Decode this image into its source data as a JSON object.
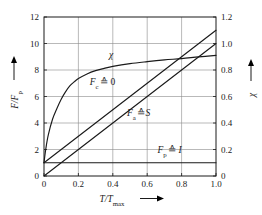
{
  "chart_data": {
    "type": "line",
    "title": "",
    "xlabel": "T/Tmax",
    "ylabel": "F/Fp",
    "y2label": "chi",
    "xlim": [
      0,
      1.0
    ],
    "ylim": [
      0,
      12
    ],
    "y2lim": [
      0,
      1.2
    ],
    "grid": true,
    "legend": "inline-annotations",
    "x_ticks": [
      "0",
      "0.2",
      "0.4",
      "0.6",
      "0.8",
      "1.0"
    ],
    "x_tick_values": [
      0,
      0.2,
      0.4,
      0.6,
      0.8,
      1.0
    ],
    "y_ticks": [
      "0",
      "2",
      "4",
      "6",
      "8",
      "10",
      "12"
    ],
    "y_tick_values": [
      0,
      2,
      4,
      6,
      8,
      10,
      12
    ],
    "y2_ticks": [
      "0",
      "0.2",
      "0.4",
      "0.6",
      "0.8",
      "1.0",
      "1.2"
    ],
    "y2_tick_values": [
      0,
      0.2,
      0.4,
      0.6,
      0.8,
      1.0,
      1.2
    ],
    "series": [
      {
        "name": "chi",
        "axis": "right",
        "x": [
          0.0,
          0.01,
          0.025,
          0.05,
          0.075,
          0.1,
          0.125,
          0.15,
          0.175,
          0.2,
          0.25,
          0.3,
          0.35,
          0.4,
          0.5,
          0.6,
          0.7,
          0.8,
          0.9,
          1.0
        ],
        "values_left_axis": [
          1.0,
          2.0,
          3.1,
          4.3,
          5.1,
          5.8,
          6.35,
          6.8,
          7.1,
          7.35,
          7.7,
          7.95,
          8.12,
          8.27,
          8.48,
          8.63,
          8.76,
          8.86,
          8.99,
          9.1
        ],
        "values_right_axis": [
          0.1,
          0.2,
          0.31,
          0.43,
          0.51,
          0.58,
          0.635,
          0.68,
          0.71,
          0.735,
          0.77,
          0.795,
          0.812,
          0.827,
          0.848,
          0.863,
          0.876,
          0.886,
          0.899,
          0.91
        ]
      },
      {
        "name": "Fc",
        "axis": "left",
        "x": [
          0.0,
          1.0
        ],
        "values": [
          1.0,
          11.0
        ]
      },
      {
        "name": "Fa",
        "axis": "left",
        "x": [
          0.0,
          1.0
        ],
        "values": [
          0.0,
          10.0
        ]
      },
      {
        "name": "Fp",
        "axis": "left",
        "x": [
          0.0,
          1.0
        ],
        "values": [
          1.0,
          1.0
        ]
      }
    ],
    "annotations": [
      {
        "id": "chi",
        "text": "chi",
        "x": 0.39,
        "y_left": 8.9
      },
      {
        "id": "fc",
        "text": "Fc = 0",
        "x": 0.34,
        "y_left": 6.9
      },
      {
        "id": "fa",
        "text": "Fa = S",
        "x": 0.55,
        "y_left": 4.55
      },
      {
        "id": "fp",
        "text": "Fp = I",
        "x": 0.73,
        "y_left": 1.75
      }
    ]
  },
  "labels": {
    "x_axis_base": "T",
    "x_axis_sub": "max",
    "x_axis_num": "T/T",
    "y_axis_num": "F/F",
    "y_axis_sub": "p",
    "y2_axis": "χ",
    "ann_chi": "χ",
    "ann_fc_base": "F",
    "ann_fc_sub": "c",
    "ann_fc_rel": "≙",
    "ann_fc_val": "0",
    "ann_fa_base": "F",
    "ann_fa_sub": "a",
    "ann_fa_rel": "≙",
    "ann_fa_val": "S",
    "ann_fp_base": "F",
    "ann_fp_sub": "p",
    "ann_fp_rel": "≙",
    "ann_fp_val": "I"
  },
  "ticks": {
    "x": [
      "0",
      "0.2",
      "0.4",
      "0.6",
      "0.8",
      "1.0"
    ],
    "y_left": [
      "0",
      "2",
      "4",
      "6",
      "8",
      "10",
      "12"
    ],
    "y_right": [
      "0",
      "0.2",
      "0.4",
      "0.6",
      "0.8",
      "1.0",
      "1.2"
    ]
  },
  "colors": {
    "curve": "#1a1a1a",
    "grid": "#8a8a8a",
    "frame": "#1a1a1a",
    "background": "#ffffff"
  }
}
